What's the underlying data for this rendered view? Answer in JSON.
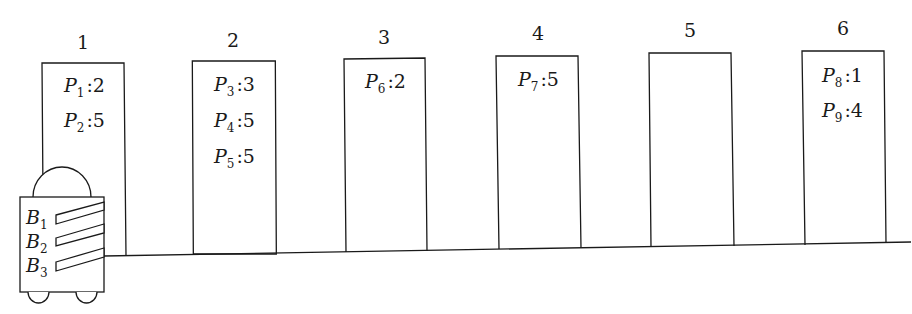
{
  "diagram": {
    "stroke_color": "#1a1a1a",
    "background": "#ffffff",
    "racks": [
      {
        "id": "1",
        "label": "1",
        "items": [
          {
            "name": "P",
            "sub": "1",
            "value": "2"
          },
          {
            "name": "P",
            "sub": "2",
            "value": "5"
          }
        ]
      },
      {
        "id": "2",
        "label": "2",
        "items": [
          {
            "name": "P",
            "sub": "3",
            "value": "3"
          },
          {
            "name": "P",
            "sub": "4",
            "value": "5"
          },
          {
            "name": "P",
            "sub": "5",
            "value": "5"
          }
        ]
      },
      {
        "id": "3",
        "label": "3",
        "items": [
          {
            "name": "P",
            "sub": "6",
            "value": "2"
          }
        ]
      },
      {
        "id": "4",
        "label": "4",
        "items": [
          {
            "name": "P",
            "sub": "7",
            "value": "5"
          }
        ]
      },
      {
        "id": "5",
        "label": "5",
        "items": []
      },
      {
        "id": "6",
        "label": "6",
        "items": [
          {
            "name": "P",
            "sub": "8",
            "value": "1"
          },
          {
            "name": "P",
            "sub": "9",
            "value": "4"
          }
        ]
      }
    ],
    "robot": {
      "bins": [
        {
          "name": "B",
          "sub": "1"
        },
        {
          "name": "B",
          "sub": "2"
        },
        {
          "name": "B",
          "sub": "3"
        }
      ]
    }
  }
}
